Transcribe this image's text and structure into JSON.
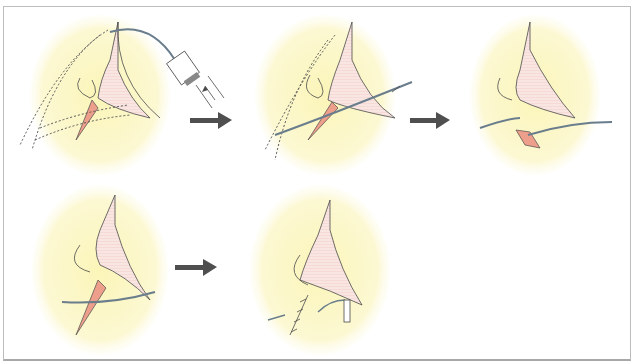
{
  "figure": {
    "type": "surgical-procedure-sequence",
    "panel_count": 5,
    "arrow_count": 3,
    "rows": [
      {
        "panels": [
          "panel-1-injection",
          "panel-2-catheter-insertion",
          "panel-3-tube-placement"
        ],
        "arrows_between": 2
      },
      {
        "panels": [
          "panel-4-wound",
          "panel-5-sutured-closure"
        ],
        "arrows_between": 1
      }
    ]
  },
  "colors": {
    "background": "#ffffff",
    "border": "#bdbdbd",
    "skin_halo": "#fbf7c8",
    "nose_fill": "#f9e3df",
    "incision": "#ee9f8c",
    "line": "#4a4a4a",
    "tube": "#6a7d8c",
    "arrow": "#4f4f4f"
  },
  "icons": {
    "arrow": "right-arrow",
    "syringe": "syringe-icon",
    "suture": "suture-icon"
  }
}
